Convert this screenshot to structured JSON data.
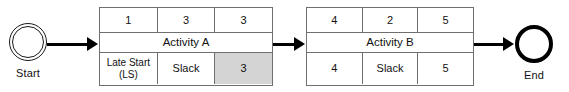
{
  "diagram": {
    "background_color": "#ffffff",
    "line_color": "#6f6f6f",
    "arrow_color": "#000000",
    "shaded_cell_color": "#d4d4d4"
  },
  "nodes": {
    "start": {
      "label": "Start",
      "shape": "double-circle"
    },
    "end": {
      "label": "End",
      "shape": "thick-circle"
    }
  },
  "activities": [
    {
      "id": "activity-a",
      "name": "Activity A",
      "top_row": [
        "1",
        "3",
        "3"
      ],
      "bottom_row": [
        "Late Start\n(LS)",
        "Slack",
        "3"
      ],
      "shaded_cell_index": 2
    },
    {
      "id": "activity-b",
      "name": "Activity B",
      "top_row": [
        "4",
        "2",
        "5"
      ],
      "bottom_row": [
        "4",
        "Slack",
        "5"
      ],
      "shaded_cell_index": -1
    }
  ],
  "connectors": [
    {
      "id": "start-to-a",
      "from": "Start",
      "to": "Activity A"
    },
    {
      "id": "a-to-b",
      "from": "Activity A",
      "to": "Activity B"
    },
    {
      "id": "b-to-end",
      "from": "Activity B",
      "to": "End"
    }
  ]
}
